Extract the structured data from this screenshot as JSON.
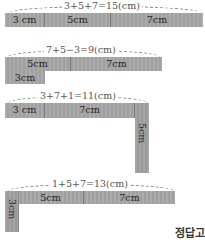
{
  "diagrams": [
    {
      "equation": "3+5+7=15(cm)",
      "segments": [
        {
          "label": "3 cm"
        },
        {
          "label": "5cm"
        },
        {
          "label": "7cm"
        }
      ]
    },
    {
      "equation": "7+5−3=9(cm)",
      "segments": [
        {
          "label": "5cm"
        },
        {
          "label": "7cm"
        }
      ],
      "below_segment": {
        "label": "3cm"
      }
    },
    {
      "equation": "3+7+1=11(cm)",
      "segments": [
        {
          "label": "3 cm"
        },
        {
          "label": "7cm"
        }
      ],
      "vertical_segment": {
        "label": "5cm"
      }
    },
    {
      "equation": "1+5+7=13(cm)",
      "segments": [
        {
          "label": "5cm"
        },
        {
          "label": "7cm"
        }
      ],
      "vertical_segment": {
        "label": "3cm"
      }
    }
  ],
  "footer": {
    "label": "정답고"
  },
  "colors": {
    "bar": "#a6a6a6",
    "text": "#222222",
    "dashed": "#777777"
  }
}
